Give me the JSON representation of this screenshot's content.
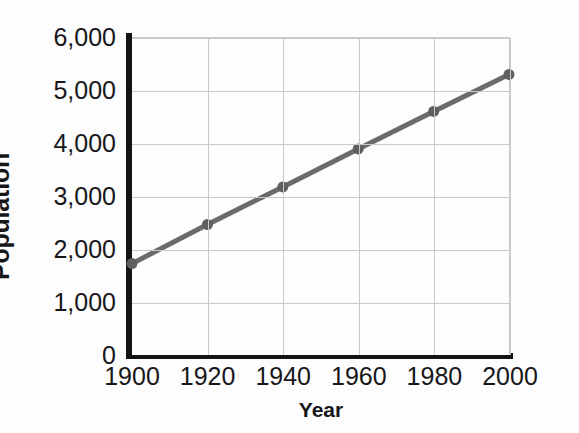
{
  "chart_data": {
    "type": "line",
    "title": "",
    "xlabel": "Year",
    "ylabel": "Population",
    "x": [
      1900,
      1920,
      1940,
      1960,
      1980,
      2000
    ],
    "categories": [
      "1900",
      "1920",
      "1940",
      "1960",
      "1980",
      "2000"
    ],
    "series": [
      {
        "name": "Population",
        "values": [
          1730,
          2470,
          3180,
          3900,
          4610,
          5310
        ],
        "color": "#6b6b6b",
        "marker": "circle"
      }
    ],
    "xlim": [
      1900,
      2000
    ],
    "ylim": [
      0,
      6000
    ],
    "x_ticks": [
      1900,
      1920,
      1940,
      1960,
      1980,
      2000
    ],
    "x_tick_labels": [
      "1900",
      "1920",
      "1940",
      "1960",
      "1980",
      "2000"
    ],
    "y_ticks": [
      0,
      1000,
      2000,
      3000,
      4000,
      5000,
      6000
    ],
    "y_tick_labels": [
      "0",
      "1,000",
      "2,000",
      "3,000",
      "4,000",
      "5,000",
      "6,000"
    ],
    "grid": true,
    "legend": false,
    "legend_position": "none",
    "annotations": []
  },
  "style": {
    "line_color": "#6b6b6b",
    "marker_color": "#5f5f5f",
    "axis_color": "#141416",
    "grid_color": "#c9c9c9",
    "text_color": "#17171a",
    "background": "#fdfdfd"
  }
}
